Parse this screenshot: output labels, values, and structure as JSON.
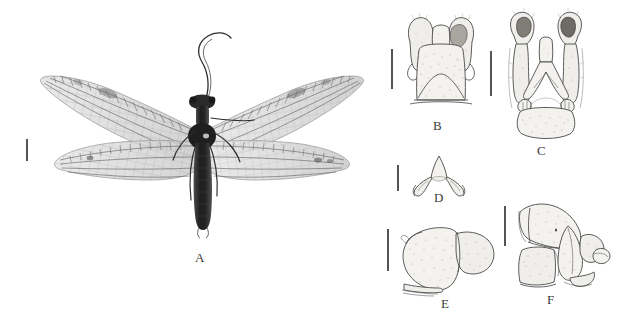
{
  "figure": {
    "type": "scientific-plate",
    "background_color": "#ffffff",
    "width": 625,
    "height": 333,
    "panel_label_color": "#3a3a3a",
    "line_color": "#4a4a4a"
  },
  "panels": [
    {
      "id": "A",
      "label": "A",
      "content": "habitus-photograph",
      "description": "Dorsal habitus photograph of a winged insect (Megaloptera/Neuroptera) with four outspread membranous wings, long filamentous antennae and an elongate dark abdomen",
      "has_scale_bar": true
    },
    {
      "id": "B",
      "label": "B",
      "content": "line-drawing",
      "description": "Male terminalia, dorsal view: paired rounded setose lobes above a broad trapezoidal tergite",
      "has_scale_bar": true
    },
    {
      "id": "C",
      "label": "C",
      "content": "line-drawing",
      "description": "Male terminalia, ventral view: paired elongate claspers with darkly sclerotised apices flanking a median plate and rounded sternite",
      "has_scale_bar": true
    },
    {
      "id": "D",
      "label": "D",
      "content": "line-drawing",
      "description": "Gonocoxite / aedeagal complex, arrow-shaped with paired recurved lateral hooks",
      "has_scale_bar": true
    },
    {
      "id": "E",
      "label": "E",
      "content": "line-drawing",
      "description": "Male terminalia, lateral view: large stippled ninth tergite with rounded posterior lobe",
      "has_scale_bar": true
    },
    {
      "id": "F",
      "label": "F",
      "content": "line-drawing",
      "description": "Male terminalia, lateral view of a second species: angular tergite, sternite and projecting apical lobe",
      "has_scale_bar": true
    }
  ],
  "scale_bars": {
    "A": {
      "x": 26,
      "y": 139,
      "length": 22,
      "orientation": "vertical"
    },
    "B": {
      "x": 391,
      "y": 49,
      "length": 40,
      "orientation": "vertical"
    },
    "C": {
      "x": 490,
      "y": 51,
      "length": 45,
      "orientation": "vertical"
    },
    "D": {
      "x": 397,
      "y": 165,
      "length": 26,
      "orientation": "vertical"
    },
    "E": {
      "x": 387,
      "y": 229,
      "length": 42,
      "orientation": "vertical"
    },
    "F": {
      "x": 504,
      "y": 206,
      "length": 40,
      "orientation": "vertical"
    }
  },
  "labels": {
    "A": {
      "text": "A",
      "x": 195,
      "y": 256
    },
    "B": {
      "text": "B",
      "x": 433,
      "y": 124
    },
    "C": {
      "text": "C",
      "x": 537,
      "y": 149
    },
    "D": {
      "text": "D",
      "x": 434,
      "y": 196
    },
    "E": {
      "text": "E",
      "x": 441,
      "y": 302
    },
    "F": {
      "text": "F",
      "x": 547,
      "y": 298
    }
  }
}
